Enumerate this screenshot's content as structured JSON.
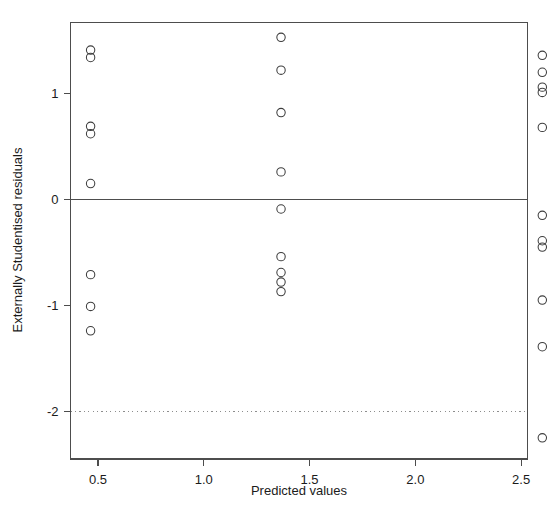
{
  "chart_data": {
    "type": "scatter",
    "title": "",
    "xlabel": "Predicted values",
    "ylabel": "Externally Studentised residuals",
    "xlim": [
      0.37,
      2.53
    ],
    "ylim": [
      -2.45,
      1.67
    ],
    "grid": false,
    "legend": false,
    "xticks": [
      0.5,
      1.0,
      1.5,
      2.0,
      2.5
    ],
    "xticklabels": [
      "0.5",
      "1.0",
      "1.5",
      "2.0",
      "2.5"
    ],
    "yticks": [
      1,
      0,
      -1,
      -2
    ],
    "yticklabels": [
      "1",
      "0",
      "-1",
      "-2"
    ],
    "reference_lines": [
      {
        "name": "zero-line",
        "y": 0,
        "style": "solid",
        "color": "#4d4d4d"
      },
      {
        "name": "lower-threshold-line",
        "y": -2,
        "style": "dotted",
        "color": "#8d8d8d"
      }
    ],
    "marker": {
      "shape": "circle",
      "filled": false,
      "radius": 4.2,
      "color": "#3d3d3d"
    },
    "x": [
      0.465,
      0.465,
      0.465,
      0.465,
      0.465,
      0.465,
      0.465,
      0.465,
      1.365,
      1.365,
      1.365,
      1.365,
      1.365,
      1.365,
      1.365,
      1.365,
      1.365,
      2.6,
      2.6,
      2.6,
      2.6,
      2.6,
      2.6,
      2.6,
      2.6,
      2.6,
      2.6,
      2.6
    ],
    "y": [
      1.41,
      1.34,
      0.69,
      0.62,
      0.15,
      -0.71,
      -1.01,
      -1.24,
      1.53,
      1.22,
      0.82,
      0.26,
      -0.09,
      -0.54,
      -0.69,
      -0.78,
      -0.87,
      1.36,
      1.2,
      1.06,
      1.01,
      0.68,
      -0.15,
      -0.39,
      -0.45,
      -0.95,
      -1.39,
      -2.25
    ],
    "groups": [
      {
        "name": "cluster-left",
        "x": 0.465,
        "values": [
          1.41,
          1.34,
          0.69,
          0.62,
          0.15,
          -0.71,
          -1.01,
          -1.24
        ]
      },
      {
        "name": "cluster-middle",
        "x": 1.365,
        "values": [
          1.53,
          1.22,
          0.82,
          0.26,
          -0.09,
          -0.54,
          -0.69,
          -0.78,
          -0.87
        ]
      },
      {
        "name": "cluster-right",
        "x": 2.6,
        "values": [
          1.36,
          1.2,
          1.06,
          1.01,
          0.68,
          -0.15,
          -0.39,
          -0.45,
          -0.95,
          -1.39,
          -2.25
        ]
      }
    ]
  },
  "axes": {
    "x_label": "Predicted values",
    "y_label": "Externally Studentised residuals",
    "x_tick_labels": [
      "0.5",
      "1.0",
      "1.5",
      "2.0",
      "2.5"
    ],
    "y_tick_labels": [
      "1",
      "0",
      "-1",
      "-2"
    ]
  },
  "colors": {
    "marker": "#3d3d3d",
    "frame": "#4d4d4d",
    "zero_line": "#4d4d4d",
    "reference_line": "#8d8d8d",
    "text": "#1b1b1b",
    "background": "#ffffff"
  }
}
